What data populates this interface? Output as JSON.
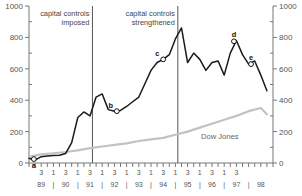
{
  "chart_data": {
    "type": "line",
    "title": "",
    "xlabel": "",
    "ylabel": "",
    "ylim": [
      0,
      1000
    ],
    "y_left_ticks": [
      "0",
      "200",
      "400",
      "600",
      "800",
      "1000"
    ],
    "y_right_ticks": [
      "0",
      "200",
      "400",
      "600",
      "800",
      "1000"
    ],
    "grid": false,
    "legend_position": "inline-annotation",
    "x_quarter_tick_labels": [
      "3",
      "1",
      "3",
      "1",
      "3",
      "1",
      "3",
      "1",
      "3",
      "1",
      "3",
      "1",
      "3",
      "1",
      "3",
      "1",
      "3"
    ],
    "x_year_labels": [
      "89",
      "90",
      "91",
      "92",
      "93",
      "94",
      "95",
      "96",
      "97",
      "98"
    ],
    "x_year_separator": "|",
    "series": [
      {
        "name": "Main index",
        "color": "#1a1a1a",
        "x": [
          1989.0,
          1989.25,
          1989.5,
          1989.75,
          1990.0,
          1990.25,
          1990.5,
          1990.75,
          1991.0,
          1991.25,
          1991.5,
          1991.75,
          1992.0,
          1992.25,
          1992.5,
          1992.75,
          1993.0,
          1993.25,
          1993.5,
          1993.75,
          1994.0,
          1994.25,
          1994.5,
          1994.75,
          1995.0,
          1995.25,
          1995.5,
          1995.75,
          1996.0,
          1996.25,
          1996.5,
          1996.75,
          1997.0,
          1997.25,
          1997.5,
          1997.75,
          1998.0,
          1998.25,
          1998.5,
          1998.75
        ],
        "values": [
          30,
          18,
          40,
          45,
          48,
          50,
          60,
          130,
          290,
          325,
          300,
          420,
          440,
          340,
          330,
          335,
          360,
          390,
          420,
          505,
          590,
          640,
          660,
          690,
          790,
          860,
          640,
          700,
          660,
          590,
          640,
          650,
          560,
          700,
          780,
          690,
          630,
          650,
          560,
          460
        ]
      },
      {
        "name": "Dow Jones",
        "color": "#c2c2c2",
        "x": [
          1989.0,
          1989.5,
          1990.0,
          1990.5,
          1991.0,
          1991.5,
          1992.0,
          1992.5,
          1993.0,
          1993.5,
          1994.0,
          1994.5,
          1995.0,
          1995.5,
          1996.0,
          1996.5,
          1997.0,
          1997.5,
          1998.0,
          1998.5,
          1998.75
        ],
        "values": [
          40,
          55,
          62,
          70,
          80,
          95,
          105,
          115,
          125,
          140,
          150,
          160,
          180,
          200,
          225,
          250,
          275,
          300,
          330,
          350,
          310
        ]
      }
    ],
    "annotations": [
      {
        "id": "capital-controls-imposed",
        "text_lines": [
          "capital controls",
          "imposed"
        ],
        "vline_x": 1991.6
      },
      {
        "id": "capital-controls-strengthened",
        "text_lines": [
          "capital controls",
          "strengthened"
        ],
        "vline_x": 1995.1
      }
    ],
    "point_markers": [
      {
        "label": "a",
        "x": 1989.2,
        "y": 25,
        "label_position": "below"
      },
      {
        "label": "b",
        "x": 1992.6,
        "y": 330,
        "label_position": "above-left"
      },
      {
        "label": "c",
        "x": 1994.5,
        "y": 660,
        "label_position": "above-left"
      },
      {
        "label": "d",
        "x": 1997.4,
        "y": 775,
        "label_position": "above"
      },
      {
        "label": "e",
        "x": 1998.1,
        "y": 630,
        "label_position": "above"
      }
    ],
    "series_inline_label": "Dow Jones",
    "colors": {
      "main_line": "#1a1a1a",
      "dow_line": "#c2c2c2",
      "axis": "#777777",
      "text": "#555555",
      "vline": "#555555"
    }
  }
}
